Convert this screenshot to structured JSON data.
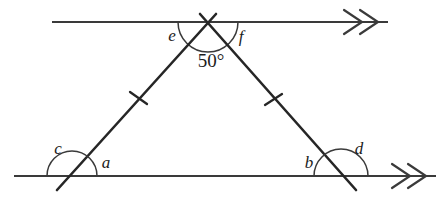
{
  "diagram": {
    "kind": "geometry-figure",
    "background_color": "#ffffff",
    "stroke_color": "#262626",
    "canvas": {
      "width": 441,
      "height": 202
    },
    "parallel_lines": [
      {
        "name": "top-parallel-line",
        "x1": 52,
        "y1": 22,
        "x2": 388,
        "y2": 22,
        "arrow_marks": 2,
        "arrow_position": "right"
      },
      {
        "name": "bottom-parallel-line",
        "x1": 14,
        "y1": 176,
        "x2": 436,
        "y2": 176,
        "arrow_marks": 2,
        "arrow_position": "right"
      }
    ],
    "vertices": {
      "apex": {
        "x": 208,
        "y": 22
      },
      "left": {
        "x": 72,
        "y": 176
      },
      "right": {
        "x": 341,
        "y": 176
      }
    },
    "legs": [
      {
        "name": "left-leg",
        "x1": 57,
        "y1": 190,
        "x2": 216,
        "y2": 14,
        "tick_marks": 1,
        "tick": {
          "x": 138,
          "y": 98
        }
      },
      {
        "name": "right-leg",
        "x1": 200,
        "y1": 14,
        "x2": 356,
        "y2": 190,
        "tick_marks": 1,
        "tick": {
          "x": 273,
          "y": 100
        }
      }
    ],
    "arcs": [
      {
        "name": "apex-angle-arc",
        "cx": 208,
        "cy": 22,
        "r": 30,
        "start_deg": 0,
        "end_deg": 180
      },
      {
        "name": "apex-interior-arc",
        "cx": 208,
        "cy": 22,
        "r": 20,
        "start_deg": 38,
        "end_deg": 142
      },
      {
        "name": "left-vertex-arc",
        "cx": 72,
        "cy": 176,
        "r": 25,
        "start_deg": 0,
        "end_deg": 180
      },
      {
        "name": "right-vertex-arc",
        "cx": 341,
        "cy": 176,
        "r": 27,
        "start_deg": 0,
        "end_deg": 180
      }
    ],
    "labels": [
      {
        "name": "angle-label-e",
        "text": "e",
        "x": 172,
        "y": 37
      },
      {
        "name": "angle-label-f",
        "text": "f",
        "x": 241,
        "y": 38
      },
      {
        "name": "angle-value-apex",
        "text": "50°",
        "x": 211,
        "y": 63
      },
      {
        "name": "angle-label-c",
        "text": "c",
        "x": 58,
        "y": 150
      },
      {
        "name": "angle-label-a",
        "text": "a",
        "x": 106,
        "y": 164
      },
      {
        "name": "angle-label-b",
        "text": "b",
        "x": 309,
        "y": 164
      },
      {
        "name": "angle-label-d",
        "text": "d",
        "x": 359,
        "y": 150
      }
    ],
    "angle_values": {
      "apex_interior": "50°"
    },
    "unknown_angles": [
      "a",
      "b",
      "c",
      "d",
      "e",
      "f"
    ]
  }
}
